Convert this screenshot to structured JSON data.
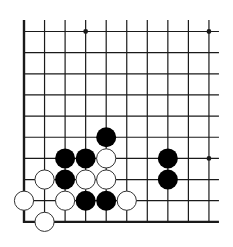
{
  "board": {
    "description": "Go board corner diagram (lower-left corner)",
    "columns": 10,
    "rows": 10,
    "origin_x": 24,
    "origin_y": 31.5,
    "col_spacing": 20.55,
    "row_spacing": 21.15,
    "stone_radius": 10,
    "edges": {
      "left": "closed",
      "bottom": "closed",
      "top": "open",
      "right": "open"
    },
    "line_color": "#1a1a1a",
    "star_points": [
      {
        "col": 3,
        "row": 0
      },
      {
        "col": 9,
        "row": 0
      },
      {
        "col": 9,
        "row": 6
      }
    ],
    "stones": [
      {
        "color": "black",
        "col": 4,
        "row": 5
      },
      {
        "color": "black",
        "col": 2,
        "row": 6
      },
      {
        "color": "black",
        "col": 3,
        "row": 6
      },
      {
        "color": "white",
        "col": 4,
        "row": 6
      },
      {
        "color": "black",
        "col": 7,
        "row": 6
      },
      {
        "color": "white",
        "col": 1,
        "row": 7
      },
      {
        "color": "black",
        "col": 2,
        "row": 7
      },
      {
        "color": "white",
        "col": 3,
        "row": 7
      },
      {
        "color": "white",
        "col": 4,
        "row": 7
      },
      {
        "color": "black",
        "col": 7,
        "row": 7
      },
      {
        "color": "white",
        "col": 0,
        "row": 8
      },
      {
        "color": "white",
        "col": 2,
        "row": 8
      },
      {
        "color": "black",
        "col": 3,
        "row": 8
      },
      {
        "color": "black",
        "col": 4,
        "row": 8
      },
      {
        "color": "white",
        "col": 5,
        "row": 8
      },
      {
        "color": "white",
        "col": 1,
        "row": 9
      }
    ],
    "colors": {
      "black_stone": "#000000",
      "white_stone": "#ffffff",
      "white_stone_outline": "#333333"
    }
  }
}
